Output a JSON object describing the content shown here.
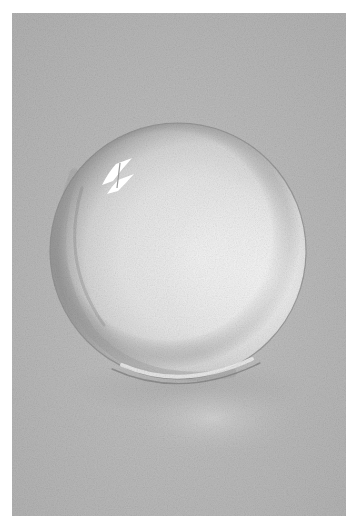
{
  "image": {
    "subject": "Pencil drawing of a glass sphere on gray paper",
    "colors": {
      "background": "#ffffff",
      "paper": "#b9b9b9",
      "sphere_body": "#e6e6e6",
      "sphere_rim_dark": "#8e8e8e",
      "highlight": "#ffffff",
      "caustic": "#cfcfcf"
    },
    "elements": {
      "sphere": "glass-sphere",
      "highlight": "window-reflection-highlight",
      "caustic": "light-caustic-shadow"
    }
  }
}
